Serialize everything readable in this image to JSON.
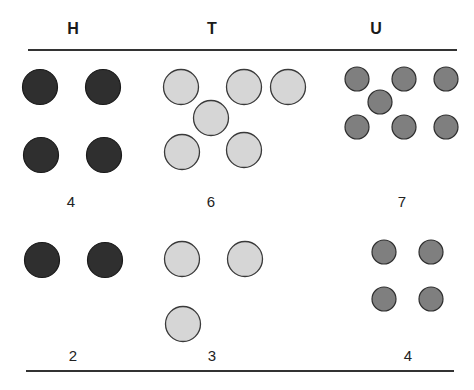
{
  "headers": {
    "h": "H",
    "t": "T",
    "u": "U"
  },
  "colors": {
    "h_fill": "#2f2f2f",
    "t_fill": "#d6d6d6",
    "u_fill": "#7f7f7f",
    "stroke": "#3a3a3a"
  },
  "rows": [
    {
      "counts": {
        "h": "4",
        "t": "6",
        "u": "7"
      }
    },
    {
      "counts": {
        "h": "2",
        "t": "3",
        "u": "4"
      }
    }
  ]
}
